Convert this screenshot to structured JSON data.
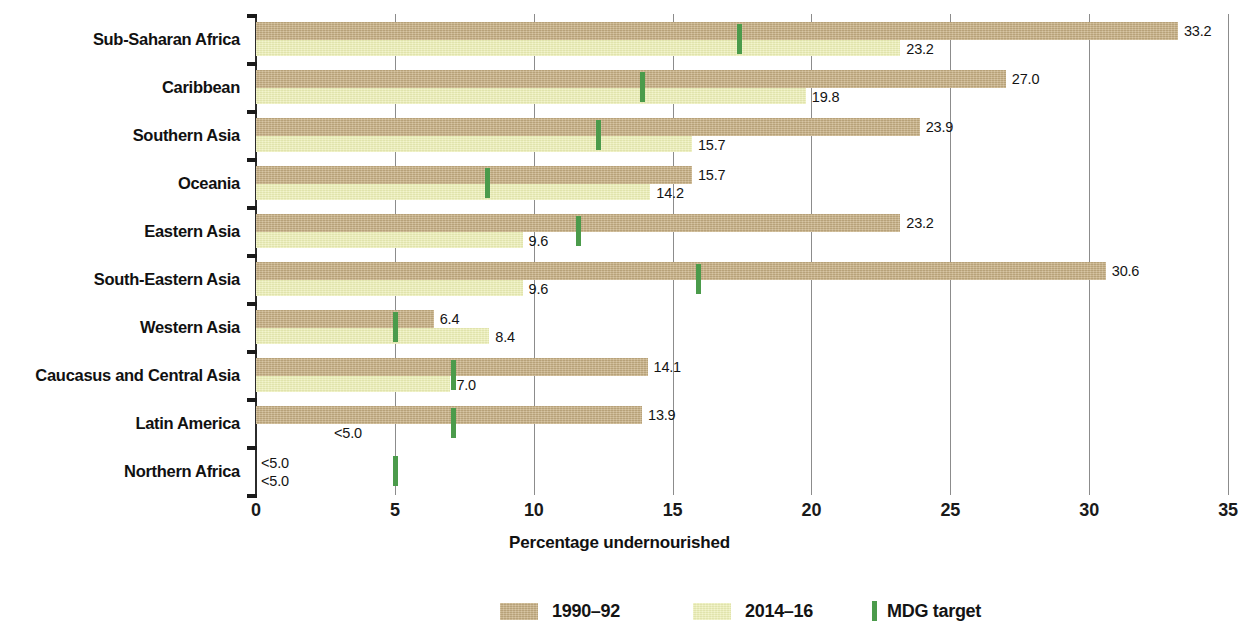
{
  "chart_data": {
    "type": "bar",
    "orientation": "horizontal",
    "title": "",
    "xlabel": "Percentage undernourished",
    "ylabel": "",
    "xlim": [
      0,
      35
    ],
    "xticks": [
      0,
      5,
      10,
      15,
      20,
      25,
      30,
      35
    ],
    "xtick_labels": [
      "0",
      "5",
      "10",
      "15",
      "20",
      "25",
      "30",
      "35"
    ],
    "grid": "vertical",
    "legend_position": "bottom",
    "categories": [
      "Sub-Saharan Africa",
      "Caribbean",
      "Southern Asia",
      "Oceania",
      "Eastern Asia",
      "South-Eastern Asia",
      "Western Asia",
      "Caucasus and Central Asia",
      "Latin America",
      "Northern Africa"
    ],
    "series": [
      {
        "name": "1990–92",
        "color": "#c9b184",
        "values": [
          33.2,
          27.0,
          23.9,
          15.7,
          23.2,
          30.6,
          6.4,
          14.1,
          13.9,
          4.9
        ],
        "labels": [
          "33.2",
          "27.0",
          "23.9",
          "15.7",
          "23.2",
          "30.6",
          "6.4",
          "14.1",
          "13.9",
          "<5.0"
        ],
        "suppressed": [
          false,
          false,
          false,
          false,
          false,
          false,
          false,
          false,
          false,
          true
        ]
      },
      {
        "name": "2014–16",
        "color": "#edf0b6",
        "values": [
          23.2,
          19.8,
          15.7,
          14.2,
          9.6,
          9.6,
          8.4,
          7.0,
          4.9,
          4.9
        ],
        "labels": [
          "23.2",
          "19.8",
          "15.7",
          "14.2",
          "9.6",
          "9.6",
          "8.4",
          "7.0",
          "<5.0",
          "<5.0"
        ],
        "suppressed": [
          false,
          false,
          false,
          false,
          false,
          false,
          false,
          false,
          true,
          true
        ]
      }
    ],
    "markers": {
      "name": "MDG target",
      "color": "#4b9b4b",
      "values": [
        17.4,
        13.9,
        12.3,
        8.3,
        11.6,
        15.9,
        5.0,
        7.1,
        7.1,
        5.0
      ]
    }
  },
  "axis": {
    "x_title": "Percentage undernourished"
  },
  "legend": {
    "items": [
      {
        "label": "1990–92",
        "type": "swatch",
        "color": "#c9b184"
      },
      {
        "label": "2014–16",
        "type": "swatch",
        "color": "#edf0b6"
      },
      {
        "label": "MDG target",
        "type": "bar-marker",
        "color": "#4b9b4b"
      }
    ]
  }
}
